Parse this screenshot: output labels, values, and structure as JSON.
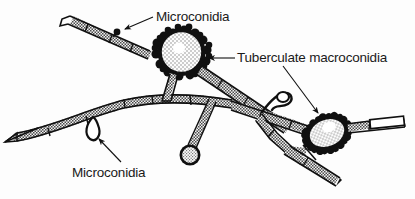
{
  "figure": {
    "background_color": "#fdfdfd",
    "ink_color": "#101010",
    "fill_gray": "#9a9a9a",
    "fill_light": "#d8d8d8"
  },
  "labels": {
    "microconidia_top": "Microconidia",
    "macroconidia_right": "Tuberculate macroconidia",
    "microconidia_bottom": "Microconidia"
  },
  "structures": {
    "macroconidium_upper": "tuberculate-macroconidium",
    "macroconidium_lower_right": "tuberculate-macroconidium",
    "microconidium_upper_hypha": "microconidium-dot",
    "microconidium_lower_hypha": "microconidium-loop",
    "microconidium_stalked": "microconidium-round-spore",
    "microconidium_hook": "microconidium-hook",
    "main_hypha": "septate-hypha",
    "branch_hyphae": "septate-hypha-branch"
  }
}
